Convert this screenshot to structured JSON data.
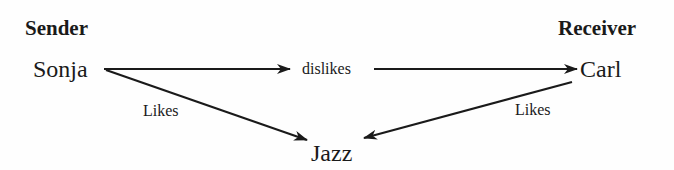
{
  "headers": {
    "sender": "Sender",
    "receiver": "Receiver"
  },
  "nodes": {
    "sonja": "Sonja",
    "carl": "Carl",
    "jazz": "Jazz",
    "dislikes": "dislikes"
  },
  "edges": {
    "sonja_likes_jazz": "Likes",
    "carl_likes_jazz": "Likes"
  },
  "colors": {
    "ink": "#1a1a1a",
    "background": "#fefefe"
  }
}
